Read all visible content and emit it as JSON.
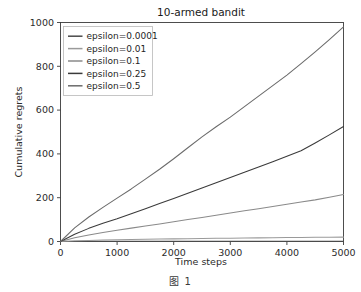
{
  "figure": {
    "caption": "图 1"
  },
  "chart_data": {
    "type": "line",
    "title": "10-armed bandit",
    "xlabel": "Time steps",
    "ylabel": "Cumulative regrets",
    "xlim": [
      0,
      5000
    ],
    "ylim": [
      0,
      1000
    ],
    "xticks": [
      0,
      1000,
      2000,
      3000,
      4000,
      5000
    ],
    "yticks": [
      0,
      200,
      400,
      600,
      800,
      1000
    ],
    "xtick_labels": [
      "0",
      "1000",
      "2000",
      "3000",
      "4000",
      "5000"
    ],
    "ytick_labels": [
      "0",
      "200",
      "400",
      "600",
      "800",
      "1000"
    ],
    "grid": false,
    "legend_position": "upper left",
    "x": [
      0,
      250,
      500,
      750,
      1000,
      1250,
      1500,
      1750,
      2000,
      2250,
      2500,
      2750,
      3000,
      3250,
      3500,
      3750,
      4000,
      4250,
      4500,
      4750,
      5000
    ],
    "series": [
      {
        "name": "epsilon=0.0001",
        "color": "#4a4a4a",
        "final_value": 1,
        "values": [
          0,
          0.3,
          0.5,
          0.6,
          0.7,
          0.7,
          0.8,
          0.8,
          0.8,
          0.9,
          0.9,
          0.9,
          0.9,
          0.9,
          1,
          1,
          1,
          1,
          1,
          1,
          1
        ]
      },
      {
        "name": "epsilon=0.01",
        "color": "#9a9a9a",
        "final_value": 20,
        "values": [
          0,
          3,
          5,
          6.5,
          8,
          9,
          10,
          11,
          12,
          13,
          13.8,
          14.5,
          15.2,
          16,
          16.6,
          17.2,
          17.8,
          18.4,
          19,
          19.5,
          20
        ]
      },
      {
        "name": "epsilon=0.1",
        "color": "#8a8a8a",
        "final_value": 215,
        "values": [
          0,
          17,
          30,
          41,
          51,
          61,
          71,
          80,
          90,
          100,
          110,
          120,
          130,
          140,
          150,
          160,
          170,
          180,
          190,
          202,
          215
        ]
      },
      {
        "name": "epsilon=0.25",
        "color": "#3a3a3a",
        "final_value": 525,
        "values": [
          0,
          33,
          60,
          83,
          104,
          127,
          150,
          173,
          196,
          220,
          244,
          268,
          292,
          316,
          340,
          364,
          389,
          414,
          450,
          487,
          525
        ]
      },
      {
        "name": "epsilon=0.5",
        "color": "#6b6b6b",
        "final_value": 980,
        "values": [
          0,
          62,
          112,
          156,
          198,
          240,
          285,
          330,
          378,
          428,
          478,
          524,
          568,
          616,
          664,
          712,
          760,
          812,
          866,
          922,
          980
        ]
      }
    ]
  }
}
